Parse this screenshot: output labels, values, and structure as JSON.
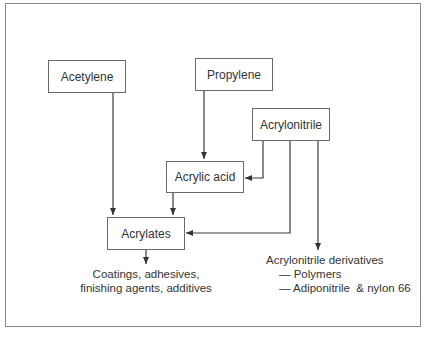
{
  "diagram": {
    "nodes": {
      "acetylene": "Acetylene",
      "propylene": "Propylene",
      "acrylonitrile": "Acrylonitrile",
      "acrylic_acid": "Acrylic acid",
      "acrylates": "Acrylates"
    },
    "outputs": {
      "acrylates_uses": [
        "Coatings, adhesives,",
        "finishing agents, additives"
      ],
      "acrylonitrile_derivatives": {
        "title": "Acrylonitrile derivatives",
        "items": [
          "— Polymers",
          "— Adiponitrile  & nylon 66"
        ]
      }
    },
    "edges": [
      {
        "from": "Acetylene",
        "to": "Acrylates"
      },
      {
        "from": "Propylene",
        "to": "Acrylic acid"
      },
      {
        "from": "Acrylonitrile",
        "to": "Acrylic acid"
      },
      {
        "from": "Acrylonitrile",
        "to": "Acrylates"
      },
      {
        "from": "Acrylonitrile",
        "to": "Acrylonitrile derivatives"
      },
      {
        "from": "Acrylic acid",
        "to": "Acrylates"
      },
      {
        "from": "Acrylates",
        "to": "Coatings, adhesives, finishing agents, additives"
      }
    ]
  }
}
